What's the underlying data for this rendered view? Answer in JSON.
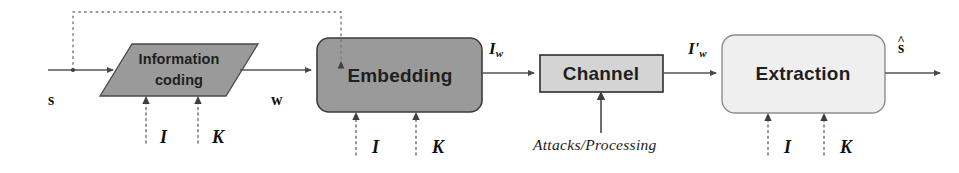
{
  "diagram": {
    "type": "block-diagram",
    "width": 959,
    "height": 173,
    "background": "#ffffff"
  },
  "blocks": [
    {
      "id": "information-coding",
      "label_line1": "Information",
      "label_line2": "coding",
      "shape": "parallelogram",
      "fill": "#9a9a9a",
      "stroke": "#4a4a4a",
      "x": 100,
      "y": 44,
      "width": 158,
      "height": 52
    },
    {
      "id": "embedding",
      "label": "Embedding",
      "shape": "rounded-rect",
      "fill": "#9a9a9a",
      "stroke": "#3c3c3c",
      "x": 317,
      "y": 38,
      "width": 165,
      "height": 74
    },
    {
      "id": "channel",
      "label": "Channel",
      "shape": "rect",
      "fill": "#d4d4d4",
      "stroke": "#2e2e2e",
      "x": 540,
      "y": 55,
      "width": 123,
      "height": 37
    },
    {
      "id": "extraction",
      "label": "Extraction",
      "shape": "rounded-rect",
      "fill": "#efefef",
      "stroke": "#8d8d8d",
      "x": 722,
      "y": 35,
      "width": 163,
      "height": 78
    }
  ],
  "signals": {
    "input_s": "s",
    "watermark_w": "w",
    "watermarked_image": "I",
    "watermarked_image_sub": "w",
    "attacked_image": "I'",
    "attacked_image_sub": "w",
    "output_s_hat": "s",
    "output_hat_mark": "^"
  },
  "parameters": {
    "information_coding": [
      {
        "label": "I"
      },
      {
        "label": "K"
      }
    ],
    "embedding": [
      {
        "label": "I"
      },
      {
        "label": "K"
      }
    ],
    "extraction": [
      {
        "label": "I"
      },
      {
        "label": "K"
      }
    ]
  },
  "annotations": {
    "attacks_processing": "Attacks/Processing"
  },
  "colors": {
    "line": "#555555",
    "dotted": "#777777",
    "text": "#1c1c1c",
    "dark_fill": "#9a9a9a",
    "mid_fill": "#d4d4d4",
    "light_fill": "#efefef"
  }
}
